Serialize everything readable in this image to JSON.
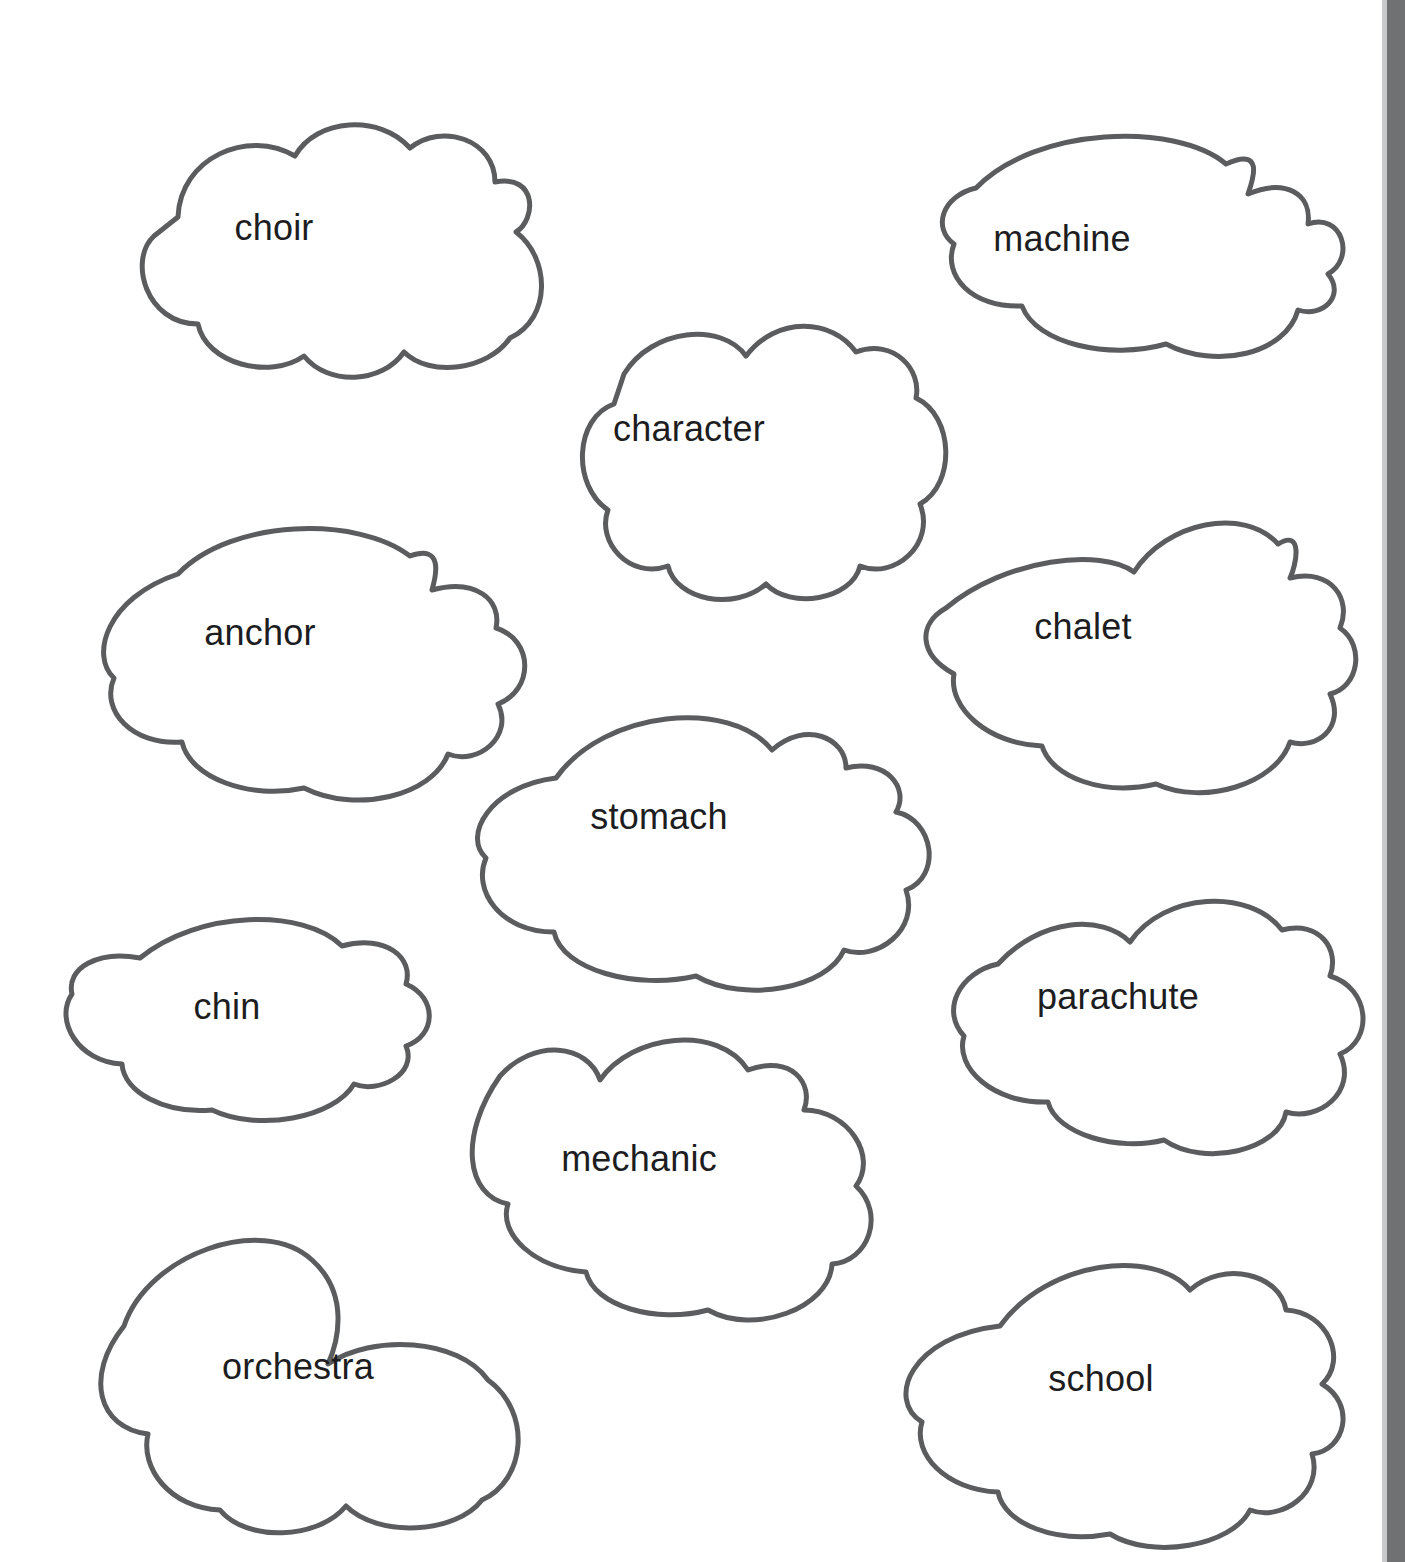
{
  "page": {
    "background_color": "#ffffff",
    "outline_color": "#5b5c5e",
    "text_color": "#1d1d1f",
    "scan_edge_color": "#6f7173"
  },
  "clouds": [
    {
      "word": "choir",
      "name": "cloud-choir",
      "x": 58,
      "y": 62,
      "w": 432,
      "h": 270,
      "font_size": 36,
      "label_x": 0,
      "label_y": 145,
      "shape": "M 120 155 C 122 96 190 66 237 94 C 258 56 322 52 352 86 C 384 60 437 78 437 120 C 480 112 478 158 458 170 C 492 196 494 256 452 276 C 430 308 372 316 346 290 C 324 322 270 324 246 294 C 212 318 148 302 140 262 C 88 262 70 198 96 174 Z"
    },
    {
      "word": "machine",
      "name": "cloud-machine",
      "x": 846,
      "y": 108,
      "w": 432,
      "h": 230,
      "font_size": 36,
      "label_x": 0,
      "label_y": 110,
      "shape": "M 130 80 C 190 18 330 14 380 56 C 420 38 406 74 402 86 C 440 70 466 86 462 116 C 496 104 510 150 482 166 C 500 188 476 210 452 202 C 440 246 370 262 320 236 C 264 252 190 236 176 198 C 126 200 96 168 108 136 C 86 120 96 88 130 80 Z"
    },
    {
      "word": "character",
      "name": "cloud-character",
      "x": 484,
      "y": 288,
      "w": 410,
      "h": 280,
      "font_size": 36,
      "label_x": 0,
      "label_y": 120,
      "shape": "M 140 86 C 168 40 238 34 262 68 C 292 28 348 30 372 64 C 410 50 438 82 432 110 C 470 128 472 196 436 216 C 452 256 410 292 376 278 C 368 312 306 322 282 296 C 250 324 192 312 184 278 C 146 292 112 254 124 222 C 88 198 90 130 130 116 Z"
    },
    {
      "word": "anchor",
      "name": "cloud-anchor",
      "x": 36,
      "y": 496,
      "w": 448,
      "h": 278,
      "font_size": 36,
      "label_x": 0,
      "label_y": 116,
      "shape": "M 142 78 C 196 22 322 20 374 60 C 408 48 400 80 396 94 C 440 82 466 104 460 132 C 498 144 498 194 462 208 C 478 240 442 270 412 258 C 396 300 320 318 268 292 C 214 304 154 282 146 246 C 96 250 64 214 78 182 C 54 160 70 102 142 78 Z"
    },
    {
      "word": "chalet",
      "name": "cloud-chalet",
      "x": 846,
      "y": 488,
      "w": 474,
      "h": 282,
      "font_size": 36,
      "label_x": 0,
      "label_y": 118,
      "shape": "M 100 120 C 160 70 256 60 288 84 C 320 34 398 18 432 56 C 458 40 450 78 444 90 C 486 80 506 112 494 140 C 520 158 512 200 484 206 C 500 240 470 262 444 254 C 430 296 358 318 310 296 C 258 308 206 290 196 258 C 142 256 102 220 108 186 C 72 166 72 136 100 120 Z"
    },
    {
      "word": "stomach",
      "name": "cloud-stomach",
      "x": 414,
      "y": 676,
      "w": 490,
      "h": 280,
      "font_size": 36,
      "label_x": 0,
      "label_y": 120,
      "shape": "M 142 102 C 190 34 316 22 358 74 C 392 44 432 62 432 92 C 472 82 496 112 482 136 C 520 144 528 200 492 214 C 506 254 462 286 430 274 C 414 312 330 328 282 300 C 222 314 148 294 140 256 C 86 256 58 214 72 182 C 48 160 76 110 142 102 Z"
    },
    {
      "word": "chin",
      "name": "cloud-chin",
      "x": 48,
      "y": 896,
      "w": 358,
      "h": 218,
      "font_size": 36,
      "label_x": 0,
      "label_y": 90,
      "shape": "M 92 62 C 150 14 256 12 294 50 C 338 38 366 62 358 88 C 390 102 388 140 358 150 C 370 178 330 198 306 188 C 286 222 210 236 164 214 C 116 218 76 196 74 168 C 30 166 6 124 24 98 C 18 72 50 54 92 62 Z"
    },
    {
      "word": "parachute",
      "name": "cloud-parachute",
      "x": 888,
      "y": 876,
      "w": 460,
      "h": 262,
      "font_size": 36,
      "label_x": 0,
      "label_y": 100,
      "shape": "M 110 88 C 152 42 214 38 242 66 C 276 16 362 12 394 54 C 432 44 452 74 442 100 C 482 112 486 164 452 178 C 470 216 430 246 398 236 C 392 274 316 292 276 264 C 230 276 168 258 160 226 C 106 228 66 192 76 160 C 52 134 72 96 110 88 Z"
    },
    {
      "word": "mechanic",
      "name": "cloud-mechanic",
      "x": 424,
      "y": 1018,
      "w": 450,
      "h": 282,
      "font_size": 36,
      "label_x": -10,
      "label_y": 120,
      "shape": "M 76 58 C 110 20 164 26 176 62 C 208 16 294 6 324 52 C 368 36 390 66 380 92 C 424 92 454 138 432 168 C 462 196 444 244 408 246 C 406 290 330 318 284 292 C 232 306 170 288 162 254 C 110 250 74 216 84 186 C 42 178 34 118 76 58 Z"
    },
    {
      "word": "orchestra",
      "name": "cloud-orchestra",
      "x": 62,
      "y": 1198,
      "w": 472,
      "h": 320,
      "font_size": 36,
      "label_x": 0,
      "label_y": 148,
      "shape": "M 62 128 C 86 56 200 16 250 62 C 288 96 276 144 266 166 C 310 136 396 140 426 182 C 470 214 464 282 420 302 C 394 336 316 340 284 308 C 256 342 184 344 158 312 C 108 310 78 270 86 236 C 36 230 22 178 62 128 Z"
    },
    {
      "word": "school",
      "name": "cloud-school",
      "x": 866,
      "y": 1238,
      "w": 470,
      "h": 280,
      "font_size": 36,
      "label_x": 0,
      "label_y": 120,
      "shape": "M 134 88 C 182 22 288 10 324 52 C 358 22 414 36 420 72 C 462 74 482 122 456 146 C 490 166 480 212 446 216 C 458 254 416 284 384 272 C 366 308 286 322 244 296 C 190 306 138 286 132 254 C 80 252 46 216 56 184 C 20 162 44 98 134 88 Z"
    }
  ]
}
